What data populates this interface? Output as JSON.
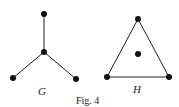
{
  "figure": {
    "caption": "Fig. 4",
    "graphs": [
      {
        "label": "G",
        "nodes": [
          {
            "id": "top",
            "x": 44,
            "y": 14
          },
          {
            "id": "center",
            "x": 44,
            "y": 52
          },
          {
            "id": "left",
            "x": 13,
            "y": 78
          },
          {
            "id": "right",
            "x": 76,
            "y": 79
          }
        ],
        "edges": [
          [
            "center",
            "top"
          ],
          [
            "center",
            "left"
          ],
          [
            "center",
            "right"
          ]
        ]
      },
      {
        "label": "H",
        "nodes": [
          {
            "id": "top",
            "x": 138,
            "y": 19
          },
          {
            "id": "left",
            "x": 107,
            "y": 77
          },
          {
            "id": "right",
            "x": 169,
            "y": 77
          },
          {
            "id": "center",
            "x": 138,
            "y": 54
          }
        ],
        "edges": [
          [
            "top",
            "left"
          ],
          [
            "left",
            "right"
          ],
          [
            "right",
            "top"
          ]
        ]
      }
    ]
  }
}
